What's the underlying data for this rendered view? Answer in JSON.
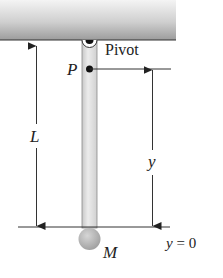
{
  "diagram": {
    "labels": {
      "pivot": "Pivot",
      "point": "P",
      "length": "L",
      "height": "y",
      "baseline": "y = 0",
      "mass": "M"
    },
    "colors": {
      "ceiling_light": "#f2f2f2",
      "ceiling_dark": "#9a9a9a",
      "rod": "#dcdcdc",
      "ball": "#b5b5b5",
      "lines": "#333333"
    }
  }
}
